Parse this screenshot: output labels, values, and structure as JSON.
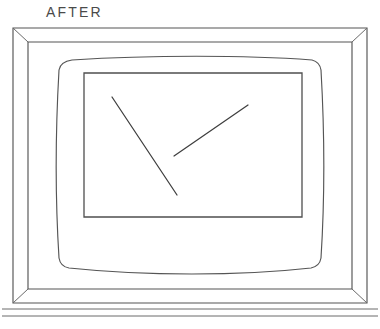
{
  "figure": {
    "caption": "AFTER",
    "background_color": "#ffffff",
    "line_color": "#555555",
    "mark_color": "#3e3e3e",
    "caption_color": "#4a4a4a"
  },
  "outer_cabinet": {
    "name": "outer-cabinet-frame",
    "outer_rect": {
      "x": 13,
      "y": 28,
      "width": 354,
      "height": 275
    },
    "inner_rect": {
      "x": 28,
      "y": 42,
      "width": 324,
      "height": 247
    },
    "bevel_corners": [
      "top-left",
      "top-right",
      "bottom-left",
      "bottom-right"
    ],
    "bottom_trim_lines_y": [
      309,
      316
    ]
  },
  "crt_bezel": {
    "name": "picture-tube-bezel",
    "top_edge_y": 57,
    "bottom_edge_y": 270,
    "left_edge_x": 59,
    "right_edge_x": 322,
    "curvature": "barrel, edges bow outward slightly"
  },
  "screen_rect": {
    "name": "screen-area",
    "x": 84,
    "y": 73,
    "width": 218,
    "height": 144
  },
  "screen_marks": [
    {
      "name": "mark-descending-stroke",
      "x1": 112,
      "y1": 97,
      "x2": 177,
      "y2": 195
    },
    {
      "name": "mark-ascending-stroke",
      "x1": 174,
      "y1": 156,
      "x2": 248,
      "y2": 105
    }
  ]
}
